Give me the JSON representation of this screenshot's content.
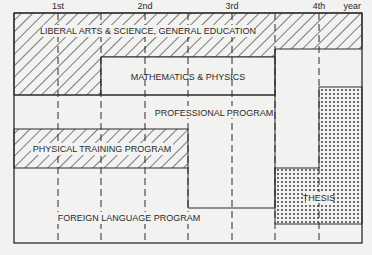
{
  "diagram": {
    "year_labels": [
      "1st",
      "2nd",
      "3rd",
      "4th",
      "year"
    ],
    "programs": [
      {
        "id": "liberal-arts",
        "label": "LIBERAL ARTS & SCIENCE, GENERAL EDUCATION",
        "fill": "hatched"
      },
      {
        "id": "math-physics",
        "label": "MATHEMATICS & PHYSICS",
        "fill": "plain"
      },
      {
        "id": "professional",
        "label": "PROFESSIONAL PROGRAM",
        "fill": "plain"
      },
      {
        "id": "physical-training",
        "label": "PHYSICAL TRAINING PROGRAM",
        "fill": "hatched"
      },
      {
        "id": "thesis",
        "label": "THESIS",
        "fill": "dotted"
      },
      {
        "id": "foreign-language",
        "label": "FOREIGN LANGUAGE PROGRAM",
        "fill": "plain"
      }
    ],
    "colors": {
      "line": "#2a2a2a",
      "background": "#f2f2f0"
    }
  }
}
